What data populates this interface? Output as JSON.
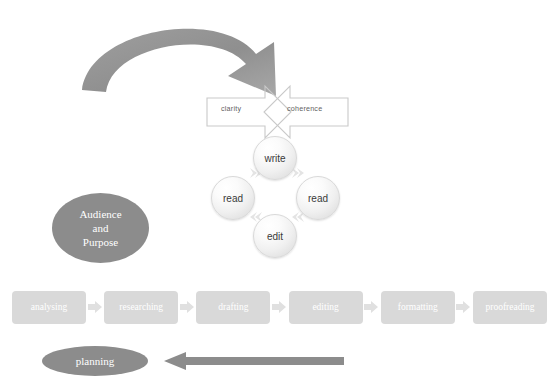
{
  "diagram": {
    "curved_arrow": {
      "name": "top-feedback-arrow",
      "color": "#9a9a9a"
    },
    "cross_arrows": {
      "clarity": "clarity",
      "coherence": "coherence",
      "stroke": "#c9c9c9"
    },
    "cycle": {
      "nodes": [
        {
          "id": "write",
          "label": "write",
          "position": "top"
        },
        {
          "id": "read-right",
          "label": "read",
          "position": "right"
        },
        {
          "id": "edit",
          "label": "edit",
          "position": "bottom"
        },
        {
          "id": "read-left",
          "label": "read",
          "position": "left"
        }
      ],
      "connector_icon": "chevron-arrow-icon"
    },
    "audience": {
      "line1": "Audience",
      "line2": "and",
      "line3": "Purpose",
      "fill": "#8c8c8c",
      "text_color": "#ffffff"
    },
    "process": {
      "steps": [
        "analysing",
        "researching",
        "drafting",
        "editing",
        "formatting",
        "proofreading"
      ],
      "separator_icon": "chevron-right-icon",
      "box_fill": "#d9d9d9",
      "text_color": "#ffffff"
    },
    "planning": {
      "label": "planning",
      "fill": "#8c8c8c",
      "text_color": "#ffffff"
    },
    "back_arrow": {
      "name": "revision-loop-arrow",
      "direction": "left",
      "color": "#8c8c8c"
    }
  }
}
